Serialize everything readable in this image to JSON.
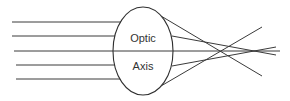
{
  "diagram": {
    "labels": {
      "upper": "Optic",
      "lower": "Axis"
    },
    "colors": {
      "line": "#3a3a3a",
      "lens": "#2f2f2f",
      "text": "#333333",
      "background": "#ffffff"
    },
    "lens": {
      "cx": 143,
      "cy": 51,
      "rx": 30,
      "ry": 44
    },
    "incoming_rays_y": [
      22,
      36,
      51,
      65,
      79
    ],
    "outer_ray_axis_crossing_x": 220,
    "inner_ray_axis_crossing_x": 255
  }
}
